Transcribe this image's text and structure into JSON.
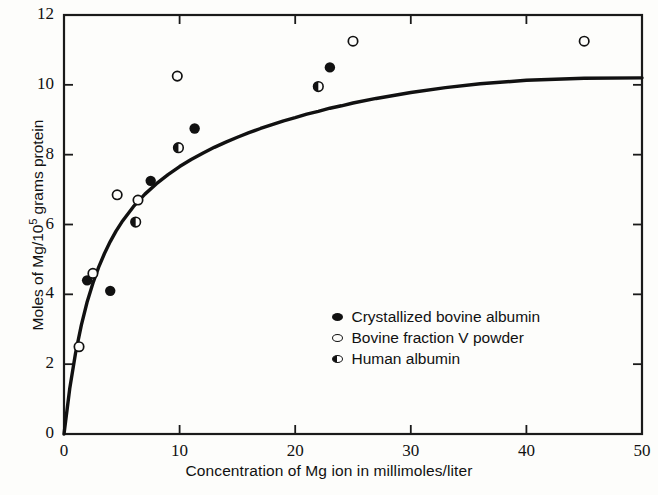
{
  "chart_data": {
    "type": "scatter",
    "title": "",
    "xlabel": "Concentration of Mg ion in millimoles/liter",
    "ylabel": "Moles of Mg/10⁵ grams protein",
    "ylabel_base": "Moles of Mg/10",
    "ylabel_exponent": "5",
    "ylabel_tail": " grams protein",
    "xlim": [
      0,
      50
    ],
    "ylim": [
      0,
      12
    ],
    "xticks": [
      0,
      10,
      20,
      30,
      40,
      50
    ],
    "yticks": [
      0,
      2,
      4,
      6,
      8,
      10,
      12
    ],
    "xtick_labels": [
      "0",
      "10",
      "20",
      "30",
      "40",
      "50"
    ],
    "ytick_labels": [
      "0",
      "2",
      "4",
      "6",
      "8",
      "10",
      "12"
    ],
    "grid": false,
    "legend_position": "center-right-lower",
    "series": [
      {
        "name": "Crystallized bovine albumin",
        "marker": "filled-circle",
        "color": "#111111",
        "points": [
          {
            "x": 2.0,
            "y": 4.4
          },
          {
            "x": 4.0,
            "y": 4.1
          },
          {
            "x": 7.5,
            "y": 7.25
          },
          {
            "x": 11.3,
            "y": 8.75
          },
          {
            "x": 23.0,
            "y": 10.5
          }
        ]
      },
      {
        "name": "Bovine fraction V powder",
        "marker": "open-circle",
        "color": "#111111",
        "points": [
          {
            "x": 1.3,
            "y": 2.5
          },
          {
            "x": 2.5,
            "y": 4.6
          },
          {
            "x": 4.6,
            "y": 6.85
          },
          {
            "x": 6.4,
            "y": 6.7
          },
          {
            "x": 9.8,
            "y": 10.25
          },
          {
            "x": 25.0,
            "y": 11.25
          },
          {
            "x": 45.0,
            "y": 11.25
          }
        ]
      },
      {
        "name": "Human albumin",
        "marker": "half-filled-circle",
        "color": "#111111",
        "points": [
          {
            "x": 6.2,
            "y": 6.07
          },
          {
            "x": 9.9,
            "y": 8.2
          },
          {
            "x": 22.0,
            "y": 9.95
          }
        ]
      }
    ],
    "fit_curve": {
      "name": "binding saturation curve",
      "plateau": 10.2,
      "half_saturation": 3.4,
      "points": [
        {
          "x": 0.0,
          "y": 0.0
        },
        {
          "x": 0.5,
          "y": 1.31
        },
        {
          "x": 1.0,
          "y": 2.32
        },
        {
          "x": 1.5,
          "y": 3.12
        },
        {
          "x": 2.0,
          "y": 3.78
        },
        {
          "x": 2.5,
          "y": 4.32
        },
        {
          "x": 3.0,
          "y": 4.78
        },
        {
          "x": 3.5,
          "y": 5.17
        },
        {
          "x": 4.0,
          "y": 5.51
        },
        {
          "x": 4.5,
          "y": 5.81
        },
        {
          "x": 5.0,
          "y": 6.07
        },
        {
          "x": 6.0,
          "y": 6.51
        },
        {
          "x": 7.0,
          "y": 6.87
        },
        {
          "x": 8.0,
          "y": 7.17
        },
        {
          "x": 9.0,
          "y": 7.43
        },
        {
          "x": 10.0,
          "y": 7.66
        },
        {
          "x": 11.0,
          "y": 7.86
        },
        {
          "x": 12.0,
          "y": 8.04
        },
        {
          "x": 13.0,
          "y": 8.21
        },
        {
          "x": 14.0,
          "y": 8.36
        },
        {
          "x": 15.0,
          "y": 8.5
        },
        {
          "x": 16.0,
          "y": 8.63
        },
        {
          "x": 17.0,
          "y": 8.75
        },
        {
          "x": 18.0,
          "y": 8.86
        },
        {
          "x": 19.0,
          "y": 8.97
        },
        {
          "x": 20.0,
          "y": 9.06
        },
        {
          "x": 21.0,
          "y": 9.16
        },
        {
          "x": 22.0,
          "y": 9.24
        },
        {
          "x": 23.0,
          "y": 9.33
        },
        {
          "x": 24.0,
          "y": 9.4
        },
        {
          "x": 25.0,
          "y": 9.48
        },
        {
          "x": 27.0,
          "y": 9.61
        },
        {
          "x": 30.0,
          "y": 9.78
        },
        {
          "x": 33.0,
          "y": 9.92
        },
        {
          "x": 36.0,
          "y": 10.03
        },
        {
          "x": 40.0,
          "y": 10.13
        },
        {
          "x": 45.0,
          "y": 10.19
        },
        {
          "x": 50.0,
          "y": 10.2
        }
      ]
    }
  },
  "legend": {
    "entries": [
      {
        "label": "Crystallized bovine albumin",
        "marker": "filled-circle"
      },
      {
        "label": "Bovine fraction V powder",
        "marker": "open-circle"
      },
      {
        "label": "Human albumin",
        "marker": "half-filled-circle"
      }
    ]
  },
  "colors": {
    "ink": "#111111",
    "background": "#fdfdfb",
    "axis": "#1a1a1a"
  }
}
